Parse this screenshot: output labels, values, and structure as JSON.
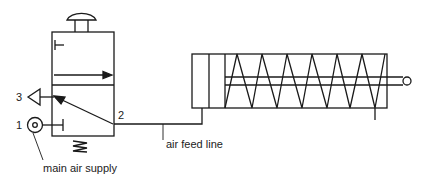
{
  "diagram": {
    "type": "pneumatic circuit",
    "components": {
      "valve": "3/2 push-button valve with spring return",
      "cylinder": "single-acting cylinder with spring return"
    },
    "port_labels": {
      "exhaust": "3",
      "supply": "1",
      "output": "2"
    },
    "annotations": {
      "air_feed_line": "air feed line",
      "main_air_supply": "main air supply"
    },
    "colors": {
      "line": "#1a1a1a",
      "background": "#ffffff"
    }
  }
}
